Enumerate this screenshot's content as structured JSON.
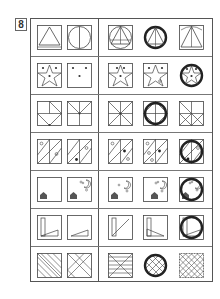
{
  "question": {
    "number": "8"
  },
  "layout": {
    "rows": 7,
    "left_columns": 2,
    "right_columns": 3
  },
  "colors": {
    "line": "#444444",
    "ring": "#222222",
    "border": "#555555"
  },
  "rows": [
    {
      "left": [
        "triangle-in-square",
        "circle-with-vertical-line"
      ],
      "right": [
        "circle-triangle-in-square",
        "circle-triangle-ring",
        "triangle-square-partial"
      ],
      "ring_position": 2
    },
    {
      "left": [
        "star-with-three-dots",
        "three-dots"
      ],
      "right": [
        "star-with-three-dots",
        "star-with-dots-variant",
        "star-dots-ring"
      ],
      "ring_position": 3
    },
    {
      "left": [
        "cross-diagonal-lines",
        "cross-v-lines"
      ],
      "right": [
        "full-cross-diagonals",
        "cross-diamond-ring",
        "cross-partial-x"
      ],
      "ring_position": 2
    },
    {
      "left": [
        "diagonal-stripes-two-circles",
        "diagonal-stripes-circle-dot"
      ],
      "right": [
        "stripes-circle-dot",
        "stripes-circles-dot",
        "stripes-dot-ring"
      ],
      "ring_position": 3
    },
    {
      "left": [
        "house",
        "house-moon-stars"
      ],
      "right": [
        "house-moon-star",
        "house-moon-stars",
        "house-moon-ring"
      ],
      "ring_position": 3
    },
    {
      "left": [
        "rectangle-triangle",
        "small-triangle"
      ],
      "right": [
        "rectangle-diagonal",
        "rectangle-triangle-variant",
        "rectangle-triangle-ring"
      ],
      "ring_position": 3
    },
    {
      "left": [
        "diagonal-hatch",
        "x-lines"
      ],
      "right": [
        "horizontal-hatch-x",
        "crosshatch-ring",
        "dense-crosshatch"
      ],
      "ring_position": 2
    }
  ]
}
